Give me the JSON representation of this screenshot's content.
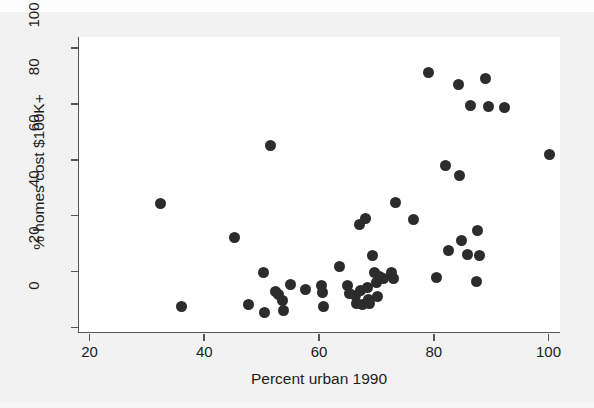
{
  "chart_data": {
    "type": "scatter",
    "title": "",
    "xlabel": "Percent urban 1990",
    "ylabel": "% homes cost $100K+",
    "xlim": [
      18,
      102
    ],
    "ylim": [
      -2,
      104
    ],
    "xticks": [
      20,
      40,
      60,
      80,
      100
    ],
    "yticks": [
      0,
      20,
      40,
      60,
      80,
      100
    ],
    "grid": false,
    "legend": null,
    "marker": {
      "shape": "circle",
      "color": "#2c2c2c",
      "size_px": 11
    },
    "points": [
      {
        "x": 32.2,
        "y": 44.4
      },
      {
        "x": 35.9,
        "y": 7.6
      },
      {
        "x": 45.1,
        "y": 32.2
      },
      {
        "x": 47.5,
        "y": 8.3
      },
      {
        "x": 50.2,
        "y": 19.5
      },
      {
        "x": 50.4,
        "y": 5.4
      },
      {
        "x": 51.3,
        "y": 65.0
      },
      {
        "x": 52.2,
        "y": 13.0
      },
      {
        "x": 52.7,
        "y": 11.7
      },
      {
        "x": 53.4,
        "y": 9.6
      },
      {
        "x": 53.6,
        "y": 6.1
      },
      {
        "x": 54.8,
        "y": 15.3
      },
      {
        "x": 57.5,
        "y": 13.5
      },
      {
        "x": 60.2,
        "y": 15.0
      },
      {
        "x": 60.4,
        "y": 12.4
      },
      {
        "x": 60.6,
        "y": 7.4
      },
      {
        "x": 63.4,
        "y": 21.8
      },
      {
        "x": 64.8,
        "y": 14.9
      },
      {
        "x": 65.2,
        "y": 12.1
      },
      {
        "x": 66.1,
        "y": 11.4
      },
      {
        "x": 66.3,
        "y": 8.5
      },
      {
        "x": 66.8,
        "y": 36.7
      },
      {
        "x": 67.1,
        "y": 13.3
      },
      {
        "x": 67.4,
        "y": 8.2
      },
      {
        "x": 67.9,
        "y": 39.1
      },
      {
        "x": 68.2,
        "y": 14.3
      },
      {
        "x": 68.4,
        "y": 10.1
      },
      {
        "x": 68.7,
        "y": 8.5
      },
      {
        "x": 69.2,
        "y": 25.8
      },
      {
        "x": 69.5,
        "y": 19.6
      },
      {
        "x": 69.8,
        "y": 16.2
      },
      {
        "x": 70.1,
        "y": 11.2
      },
      {
        "x": 70.4,
        "y": 18.4
      },
      {
        "x": 71.0,
        "y": 17.4
      },
      {
        "x": 72.4,
        "y": 19.7
      },
      {
        "x": 72.8,
        "y": 17.6
      },
      {
        "x": 73.1,
        "y": 44.8
      },
      {
        "x": 76.3,
        "y": 38.8
      },
      {
        "x": 78.9,
        "y": 91.3
      },
      {
        "x": 80.3,
        "y": 17.7
      },
      {
        "x": 81.8,
        "y": 57.9
      },
      {
        "x": 82.4,
        "y": 27.6
      },
      {
        "x": 84.1,
        "y": 87.0
      },
      {
        "x": 84.3,
        "y": 54.3
      },
      {
        "x": 84.6,
        "y": 31.2
      },
      {
        "x": 85.7,
        "y": 26.1
      },
      {
        "x": 86.2,
        "y": 79.4
      },
      {
        "x": 87.2,
        "y": 16.4
      },
      {
        "x": 87.5,
        "y": 34.8
      },
      {
        "x": 87.8,
        "y": 25.9
      },
      {
        "x": 88.9,
        "y": 89.0
      },
      {
        "x": 89.3,
        "y": 79.1
      },
      {
        "x": 92.2,
        "y": 78.6
      },
      {
        "x": 100.0,
        "y": 62.0
      }
    ]
  }
}
